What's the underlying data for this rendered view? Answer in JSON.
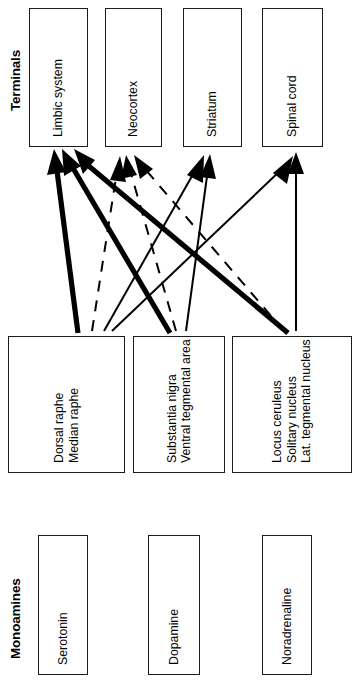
{
  "figure": {
    "orientation": "rotated-90-ccw",
    "columns": [
      {
        "key": "monoamines",
        "label": "Monoamines"
      },
      {
        "key": "origin",
        "label": "Origin"
      },
      {
        "key": "terminals",
        "label": "Terminals"
      }
    ]
  },
  "monoamines": [
    {
      "id": "serotonin",
      "label": "Serotonin"
    },
    {
      "id": "dopamine",
      "label": "Dopamine"
    },
    {
      "id": "noradrenaline",
      "label": "Noradrenaline"
    }
  ],
  "origin": [
    {
      "id": "raphe",
      "lines": [
        "Dorsal raphe",
        "Median raphe"
      ]
    },
    {
      "id": "nigra",
      "lines": [
        "Substantia nigra",
        "Ventral tegmental area"
      ]
    },
    {
      "id": "ceruleus",
      "lines": [
        "Locus ceruleus",
        "Solitary nucleus",
        "Lat. tegmental nucleus"
      ]
    }
  ],
  "terminals": [
    {
      "id": "limbic",
      "label": "Limbic system"
    },
    {
      "id": "neocortex",
      "label": "Neocortex"
    },
    {
      "id": "striatum",
      "label": "Striatum"
    },
    {
      "id": "spinal",
      "label": "Spinal cord"
    }
  ],
  "connections": [
    {
      "from": "raphe",
      "to": "limbic",
      "style": "solid-thick"
    },
    {
      "from": "raphe",
      "to": "neocortex",
      "style": "dashed"
    },
    {
      "from": "raphe",
      "to": "striatum",
      "style": "solid-thin"
    },
    {
      "from": "raphe",
      "to": "spinal",
      "style": "solid-thin"
    },
    {
      "from": "nigra",
      "to": "limbic",
      "style": "solid-thick"
    },
    {
      "from": "nigra",
      "to": "neocortex",
      "style": "dashed"
    },
    {
      "from": "nigra",
      "to": "striatum",
      "style": "solid-thin"
    },
    {
      "from": "ceruleus",
      "to": "limbic",
      "style": "solid-thick"
    },
    {
      "from": "ceruleus",
      "to": "neocortex",
      "style": "dashed"
    },
    {
      "from": "ceruleus",
      "to": "spinal",
      "style": "solid-thin"
    }
  ],
  "style": {
    "stroke": "#000000",
    "background": "#ffffff",
    "box_border": "#1a1a1a"
  }
}
